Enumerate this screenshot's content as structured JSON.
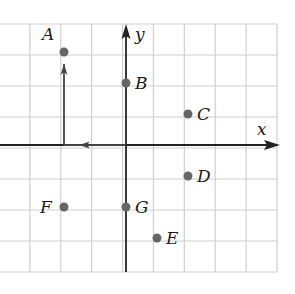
{
  "diagram": {
    "type": "coordinate-plane",
    "axes": {
      "x_label": "x",
      "y_label": "y"
    },
    "grid": {
      "x_range": [
        -4,
        5
      ],
      "y_range": [
        -4,
        4
      ],
      "unit_px": 31,
      "origin_px": [
        126,
        145
      ],
      "line_color": "#cfcfcf",
      "axis_color": "#222222"
    },
    "points": [
      {
        "label": "A",
        "x": -2,
        "y": 3,
        "label_side": "upper-left"
      },
      {
        "label": "B",
        "x": 0,
        "y": 2,
        "label_side": "right"
      },
      {
        "label": "C",
        "x": 2,
        "y": 1,
        "label_side": "right"
      },
      {
        "label": "D",
        "x": 2,
        "y": -1,
        "label_side": "right"
      },
      {
        "label": "E",
        "x": 1,
        "y": -3,
        "label_side": "right"
      },
      {
        "label": "F",
        "x": -2,
        "y": -2,
        "label_side": "left"
      },
      {
        "label": "G",
        "x": 0,
        "y": -2,
        "label_side": "right"
      }
    ],
    "path_arrows": [
      {
        "from": [
          0,
          0
        ],
        "to": [
          -2,
          0
        ],
        "direction": "left"
      },
      {
        "from": [
          -2,
          0
        ],
        "to": [
          -2,
          3
        ],
        "direction": "up"
      }
    ],
    "point_color": "#666666"
  },
  "chart_data": {
    "type": "scatter",
    "title": "",
    "xlabel": "x",
    "ylabel": "y",
    "xlim": [
      -4,
      5
    ],
    "ylim": [
      -4,
      4
    ],
    "grid": true,
    "series": [
      {
        "name": "points",
        "labels": [
          "A",
          "B",
          "C",
          "D",
          "E",
          "F",
          "G"
        ],
        "x": [
          -2,
          0,
          2,
          2,
          1,
          -2,
          0
        ],
        "y": [
          3,
          2,
          1,
          -1,
          -3,
          -2,
          -2
        ]
      }
    ]
  }
}
